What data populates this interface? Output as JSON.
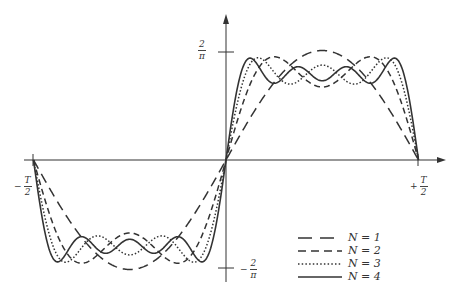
{
  "chart_data": {
    "type": "line",
    "title": "",
    "xlabel": "",
    "ylabel": "",
    "function": "Fourier partial sums of odd square wave: (4/pi) * sum_{k=1}^{N} sin((2k-1)*2*pi*t/T)/(2k-1)",
    "x_ticks": [
      {
        "label": "-T/2",
        "value": -0.5
      },
      {
        "label": "+T/2",
        "value": 0.5
      }
    ],
    "y_ticks": [
      {
        "label": "2/π",
        "value": 1
      },
      {
        "label": "-2/π",
        "value": -1
      }
    ],
    "xlim": [
      -0.5,
      0.5
    ],
    "grid": false,
    "legend_position": "lower right",
    "series": [
      {
        "name": "N = 1",
        "N": 1,
        "style": "long-dash"
      },
      {
        "name": "N = 2",
        "N": 2,
        "style": "dash"
      },
      {
        "name": "N = 3",
        "N": 3,
        "style": "dotted"
      },
      {
        "name": "N = 4",
        "N": 4,
        "style": "solid"
      }
    ]
  },
  "labels": {
    "y_top": {
      "num": "2",
      "den": "π",
      "sign": ""
    },
    "y_bottom": {
      "num": "2",
      "den": "π",
      "sign": "−"
    },
    "x_left": {
      "num": "T",
      "den": "2",
      "sign": "−"
    },
    "x_right": {
      "num": "T",
      "den": "2",
      "sign": "+"
    }
  },
  "legend": [
    {
      "label": "N = 1",
      "dash": "10,6"
    },
    {
      "label": "N = 2",
      "dash": "6,4"
    },
    {
      "label": "N = 3",
      "dash": "1.5,2"
    },
    {
      "label": "N = 4",
      "dash": ""
    }
  ]
}
